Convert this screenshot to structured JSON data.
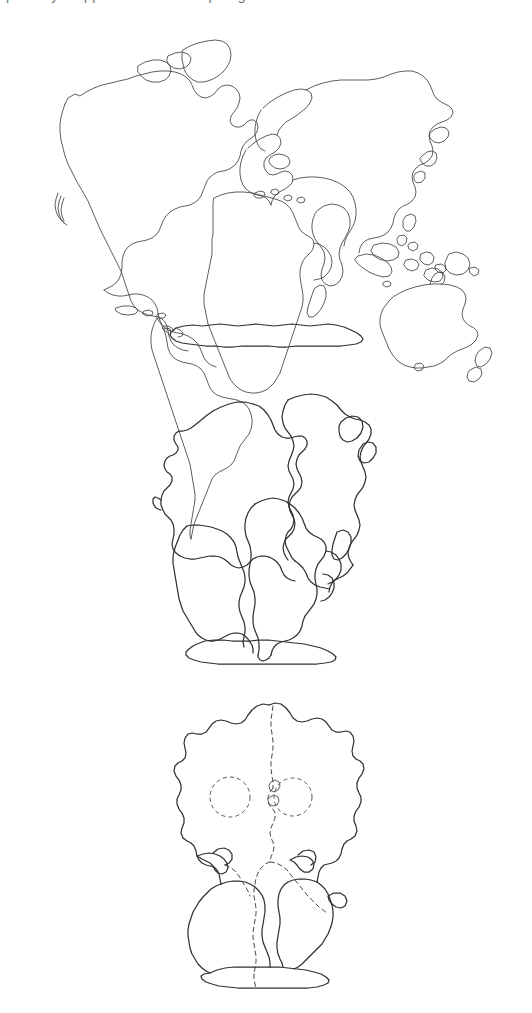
{
  "figure": {
    "caption_fragment": "partially cropped text line at top edge",
    "background_color": "#ffffff",
    "line_color": "#3b3b3d",
    "dashed_line_color": "#4a4a4d",
    "panel_count": 3
  },
  "panels": [
    {
      "id": "present-day",
      "order": 1,
      "label": "Present day continents",
      "description": "Modern world map outline with North America, South America, Europe, Africa, Asia and Australia, plus a separate flattened Antarctica strip below",
      "landmasses": [
        "North America",
        "Greenland",
        "South America",
        "Europe",
        "Africa",
        "Asia",
        "India",
        "Australia",
        "New Zealand",
        "Japan",
        "Indonesia",
        "Philippines",
        "Madagascar",
        "Caribbean islands",
        "Antarctica"
      ],
      "has_dashed_boundaries": false
    },
    {
      "id": "breakup",
      "order": 2,
      "label": "Continents separating",
      "description": "Intermediate stage with continents drifted apart, rift gaps visible between North America, Eurasia, South America and Africa, Antarctica attached at the base",
      "landmasses": [
        "North America",
        "Eurasia",
        "South America",
        "Africa",
        "India",
        "Australia",
        "Antarctica"
      ],
      "has_dashed_boundaries": false
    },
    {
      "id": "pangaea",
      "order": 3,
      "label": "Pangaea supercontinent",
      "description": "All landmasses joined into a single supercontinent with dashed internal boundaries marking future continental margins and two dashed circular inland sea outlines",
      "landmasses": [
        "Laurasia",
        "Gondwana",
        "Antarctica"
      ],
      "has_dashed_boundaries": true,
      "dashed_circles": 2
    }
  ]
}
